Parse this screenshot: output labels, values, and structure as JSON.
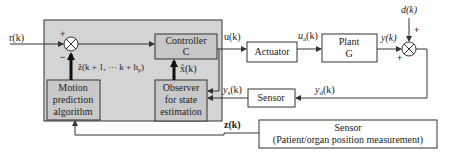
{
  "colors": {
    "background": "#ffffff",
    "shaded_region": "#d4d4d4",
    "block_fill_inner": "#c8c8c8",
    "stroke": "#333333"
  },
  "signals": {
    "reference": "r(k)",
    "control": "u(k)",
    "actuated_prefix": "u",
    "actuated_sub": "a",
    "actuated_suffix": "(k)",
    "plant_output": "y(k)",
    "disturbance": "d(k)",
    "disturbed_prefix": "y",
    "disturbed_sub": "d",
    "disturbed_suffix": "(k)",
    "sensed_prefix": "y",
    "sensed_sub": "s",
    "sensed_suffix": "(k)",
    "measurement": "z(k)",
    "state_estimate": "x̂(k)",
    "prediction_prefix": "ẑ(k + 1, ··· k + h",
    "prediction_sub": "p",
    "prediction_suffix": ")"
  },
  "blocks": {
    "controller": {
      "line1": "Controller",
      "line2": "C"
    },
    "actuator": {
      "line1": "Actuator"
    },
    "plant": {
      "line1": "Plant",
      "line2": "G"
    },
    "sensor_feedback": {
      "line1": "Sensor"
    },
    "motion_prediction": {
      "line1": "Motion",
      "line2": "prediction",
      "line3": "algorithm"
    },
    "observer": {
      "line1": "Observer",
      "line2": "for state",
      "line3": "estimation"
    },
    "sensor_patient": {
      "line1": "Sensor",
      "line2": "(Patient/organ position measurement)"
    }
  },
  "junctions": {
    "sum1": {
      "top_sign": "+",
      "bottom_sign": "−"
    },
    "sum2": {
      "top_sign": "+",
      "left_sign": "+"
    }
  }
}
